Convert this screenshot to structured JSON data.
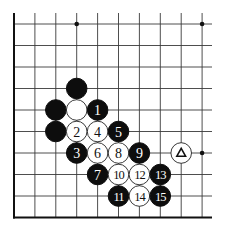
{
  "board": {
    "origin_x": 14,
    "origin_y": 24,
    "spacing_x": 20.9,
    "spacing_y": 21.5,
    "cols": 10,
    "rows": 9,
    "top_line_start_y": 13,
    "right_line_end_x": 212,
    "left_edge_col": 0,
    "bottom_edge_row": 9,
    "stone_radius": 10.3,
    "colors": {
      "black": "#0d0d0d",
      "white": "#ffffff",
      "line": "#3a3a3a"
    }
  },
  "hoshi": [
    {
      "col": 3,
      "row": 0
    },
    {
      "col": 9,
      "row": 0
    },
    {
      "col": 9,
      "row": 6
    }
  ],
  "stones": [
    {
      "col": 3,
      "row": 3,
      "color": "black",
      "label": ""
    },
    {
      "col": 2,
      "row": 4,
      "color": "black",
      "label": ""
    },
    {
      "col": 3,
      "row": 4,
      "color": "white",
      "label": ""
    },
    {
      "col": 4,
      "row": 4,
      "color": "black",
      "label": "1"
    },
    {
      "col": 2,
      "row": 5,
      "color": "black",
      "label": ""
    },
    {
      "col": 3,
      "row": 5,
      "color": "white",
      "label": "2"
    },
    {
      "col": 4,
      "row": 5,
      "color": "white",
      "label": "4"
    },
    {
      "col": 5,
      "row": 5,
      "color": "black",
      "label": "5"
    },
    {
      "col": 3,
      "row": 6,
      "color": "black",
      "label": "3"
    },
    {
      "col": 4,
      "row": 6,
      "color": "white",
      "label": "6"
    },
    {
      "col": 5,
      "row": 6,
      "color": "white",
      "label": "8"
    },
    {
      "col": 6,
      "row": 6,
      "color": "black",
      "label": "9"
    },
    {
      "col": 8,
      "row": 6,
      "color": "white",
      "label": "",
      "mark": "triangle"
    },
    {
      "col": 4,
      "row": 7,
      "color": "black",
      "label": "7"
    },
    {
      "col": 5,
      "row": 7,
      "color": "white",
      "label": "10"
    },
    {
      "col": 6,
      "row": 7,
      "color": "white",
      "label": "12"
    },
    {
      "col": 7,
      "row": 7,
      "color": "black",
      "label": "13"
    },
    {
      "col": 5,
      "row": 8,
      "color": "black",
      "label": "11"
    },
    {
      "col": 6,
      "row": 8,
      "color": "white",
      "label": "14"
    },
    {
      "col": 7,
      "row": 8,
      "color": "black",
      "label": "15"
    }
  ]
}
